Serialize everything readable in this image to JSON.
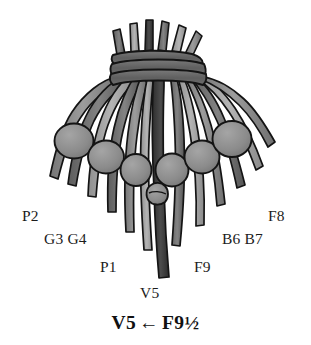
{
  "figure": {
    "name": "quipu-diagram",
    "background_color": "#ffffff",
    "palette": {
      "outline": "#141414",
      "cord_mid_gray": "#8c8c8c",
      "cord_light_gray": "#ababab",
      "cord_dark_gray": "#4a4a4a",
      "cord_darkest": "#343434",
      "knot_fill": "#8d8d8d",
      "band_fill": "#6d6d6d",
      "label_color": "#1c1c1c"
    }
  },
  "labels": [
    {
      "id": "label-p2",
      "text": "P2",
      "x": 22,
      "y": 208
    },
    {
      "id": "label-f8",
      "text": "F8",
      "x": 268,
      "y": 208
    },
    {
      "id": "label-g3-g4",
      "text": "G3 G4",
      "x": 44,
      "y": 231
    },
    {
      "id": "label-b6-b7",
      "text": "B6 B7",
      "x": 222,
      "y": 231
    },
    {
      "id": "label-p1",
      "text": "P1",
      "x": 100,
      "y": 259
    },
    {
      "id": "label-f9",
      "text": "F9",
      "x": 194,
      "y": 259
    },
    {
      "id": "label-v5",
      "text": "V5",
      "x": 140,
      "y": 285
    }
  ],
  "caption": {
    "left_term": "V5",
    "arrow": "←",
    "right_term": "F9½",
    "full_text": "V5 ← F9½"
  },
  "structure": {
    "pendant_cord_count": 13,
    "knot_cluster_count": 6,
    "wrap_band_count": 3,
    "top_tuft_count": 6
  }
}
